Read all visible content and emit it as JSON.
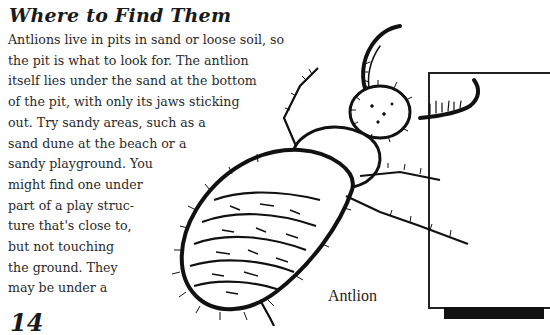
{
  "section": {
    "heading": "Where to Find Them",
    "paragraph_lines": [
      "Antlions live in pits in sand or loose soil, so",
      "the pit is what to look for. The antlion",
      "itself lies under the sand at the bottom",
      "of the pit, with only its jaws sticking",
      "out.  Try sandy areas, such as a",
      "sand dune at the beach or a",
      "sandy  playground.  You",
      "might  find  one  under",
      "part of a play struc-",
      "ture that's close to,",
      "but  not  touching",
      "the  ground.  They",
      "may  be  under  a"
    ]
  },
  "figure": {
    "illustration": "antlion-larva-drawing",
    "caption": "Antlion"
  },
  "page": {
    "number": "14"
  },
  "colors": {
    "ink": "#1a1a1a",
    "paper": "#ffffff"
  }
}
